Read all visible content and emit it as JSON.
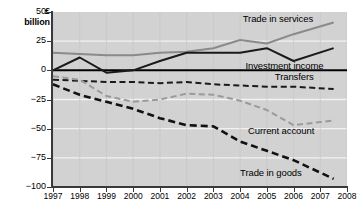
{
  "chart_data": {
    "type": "line",
    "title": "",
    "xlabel": "",
    "ylabel": "£ billion",
    "unit_label_line1": "£",
    "unit_label_line2": "billion",
    "x": [
      1997,
      1998,
      1999,
      2000,
      2001,
      2002,
      2003,
      2004,
      2005,
      2006,
      2007,
      2008
    ],
    "xtick_labels": [
      "1997",
      "1998",
      "1999",
      "2000",
      "2001",
      "2002",
      "2003",
      "2004",
      "2005",
      "2006",
      "2007",
      "2008"
    ],
    "ytick_labels": [
      "50",
      "25",
      "0",
      "−25",
      "−50",
      "−75",
      "−100"
    ],
    "ytick_values": [
      50,
      25,
      0,
      -25,
      -50,
      -75,
      -100
    ],
    "ylim": [
      -100,
      50
    ],
    "xlim": [
      1997,
      2008
    ],
    "grid": "horizontal-white",
    "legend": "inline-labels",
    "plot_background": "#d2d2d2",
    "gridline_color": "#f2f2f2",
    "series": [
      {
        "name": "Trade in services",
        "color": "#8a8a8a",
        "style": "solid",
        "width": 2,
        "x": [
          1997,
          1998,
          1999,
          2000,
          2001,
          2002,
          2003,
          2004,
          2005,
          2006,
          2007.5
        ],
        "values": [
          15,
          14,
          13,
          13,
          15,
          16,
          19,
          26,
          23,
          31,
          41
        ],
        "label_x": 2004.1,
        "label_y": 44
      },
      {
        "name": "Investment income",
        "color": "#1a1a1a",
        "style": "solid",
        "width": 2,
        "x": [
          1997,
          1998,
          1999,
          2000,
          2001,
          2002,
          2003,
          2004,
          2005,
          2006,
          2007.5
        ],
        "values": [
          0,
          11,
          -2,
          0,
          8,
          15,
          15,
          15,
          19,
          8,
          19
        ],
        "label_x": 2004.2,
        "label_y": 4
      },
      {
        "name": "Transfers",
        "color": "#1a1a1a",
        "style": "dashed",
        "width": 2,
        "x": [
          1997,
          1998,
          1999,
          2000,
          2001,
          2002,
          2003,
          2004,
          2005,
          2006,
          2007.5
        ],
        "values": [
          -8,
          -9,
          -10,
          -10,
          -11,
          -10,
          -12,
          -13,
          -14,
          -14,
          -16
        ],
        "label_x": 2005.3,
        "label_y": -6
      },
      {
        "name": "Current account",
        "color": "#9a9a9a",
        "style": "dashed",
        "width": 2,
        "x": [
          1997,
          1998,
          1999,
          2000,
          2001,
          2002,
          2003,
          2004,
          2005,
          2006,
          2007.5
        ],
        "values": [
          -5,
          -8,
          -22,
          -27,
          -25,
          -20,
          -21,
          -26,
          -34,
          -47,
          -43
        ],
        "label_x": 2004.3,
        "label_y": -52
      },
      {
        "name": "Trade in goods",
        "color": "#111111",
        "style": "dashed",
        "width": 2.6,
        "x": [
          1997,
          1998,
          1999,
          2000,
          2001,
          2002,
          2003,
          2004,
          2005,
          2006,
          2007.5
        ],
        "values": [
          -12,
          -21,
          -27,
          -33,
          -41,
          -47,
          -48,
          -61,
          -69,
          -77,
          -93
        ],
        "label_x": 2004.0,
        "label_y": -88
      }
    ]
  }
}
